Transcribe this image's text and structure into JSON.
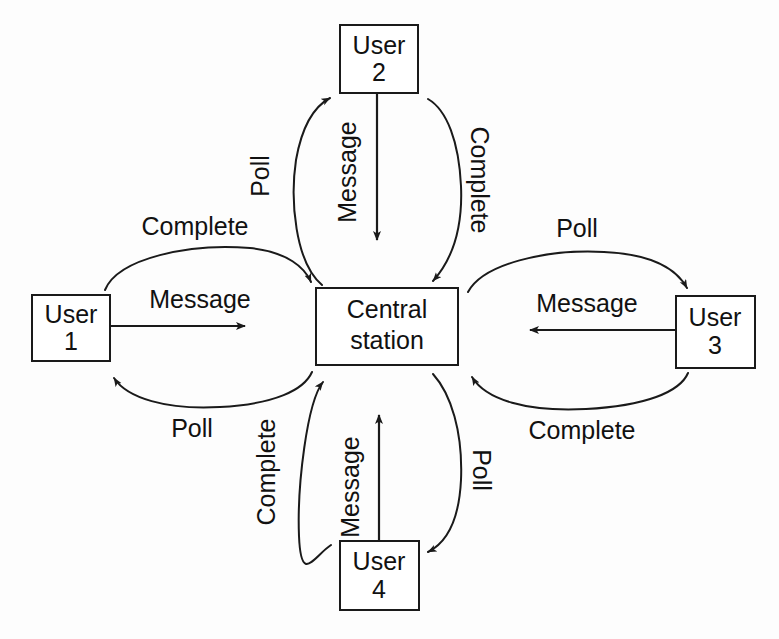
{
  "diagram": {
    "type": "polling-network-diagram",
    "caption_faint": "",
    "colors": {
      "stroke": "#1a1a1a",
      "text": "#111111",
      "background": "#fdfdfd",
      "box_fill": "#ffffff"
    },
    "nodes": [
      {
        "id": "central",
        "label_line1": "Central",
        "label_line2": "station",
        "position": "center"
      },
      {
        "id": "user1",
        "label_line1": "User",
        "label_line2": "1",
        "position": "left"
      },
      {
        "id": "user2",
        "label_line1": "User",
        "label_line2": "2",
        "position": "top"
      },
      {
        "id": "user3",
        "label_line1": "User",
        "label_line2": "3",
        "position": "right"
      },
      {
        "id": "user4",
        "label_line1": "User",
        "label_line2": "4",
        "position": "bottom"
      }
    ],
    "edges": [
      {
        "id": "u1-message",
        "label": "Message",
        "from": "user1",
        "to": "central",
        "style": "straight",
        "orientation": "horizontal",
        "rotation": 0
      },
      {
        "id": "u1-complete",
        "label": "Complete",
        "from": "user1",
        "to": "central",
        "style": "curve",
        "orientation": "horizontal",
        "rotation": 0
      },
      {
        "id": "u1-poll",
        "label": "Poll",
        "from": "central",
        "to": "user1",
        "style": "curve",
        "orientation": "horizontal",
        "rotation": 0
      },
      {
        "id": "u2-message",
        "label": "Message",
        "from": "user2",
        "to": "central",
        "style": "straight",
        "orientation": "vertical",
        "rotation": -90
      },
      {
        "id": "u2-poll",
        "label": "Poll",
        "from": "central",
        "to": "user2",
        "style": "curve",
        "orientation": "vertical",
        "rotation": -90
      },
      {
        "id": "u2-complete",
        "label": "Complete",
        "from": "user2",
        "to": "central",
        "style": "curve",
        "orientation": "vertical",
        "rotation": 90
      },
      {
        "id": "u3-message",
        "label": "Message",
        "from": "user3",
        "to": "central",
        "style": "straight",
        "orientation": "horizontal",
        "rotation": 0
      },
      {
        "id": "u3-poll",
        "label": "Poll",
        "from": "central",
        "to": "user3",
        "style": "curve",
        "orientation": "horizontal",
        "rotation": 0
      },
      {
        "id": "u3-complete",
        "label": "Complete",
        "from": "user3",
        "to": "central",
        "style": "curve",
        "orientation": "horizontal",
        "rotation": 0
      },
      {
        "id": "u4-message",
        "label": "Message",
        "from": "user4",
        "to": "central",
        "style": "straight",
        "orientation": "vertical",
        "rotation": -90
      },
      {
        "id": "u4-complete",
        "label": "Complete",
        "from": "user4",
        "to": "central",
        "style": "curve",
        "orientation": "vertical",
        "rotation": -90
      },
      {
        "id": "u4-poll",
        "label": "Poll",
        "from": "central",
        "to": "user4",
        "style": "curve",
        "orientation": "vertical",
        "rotation": 90
      }
    ]
  }
}
